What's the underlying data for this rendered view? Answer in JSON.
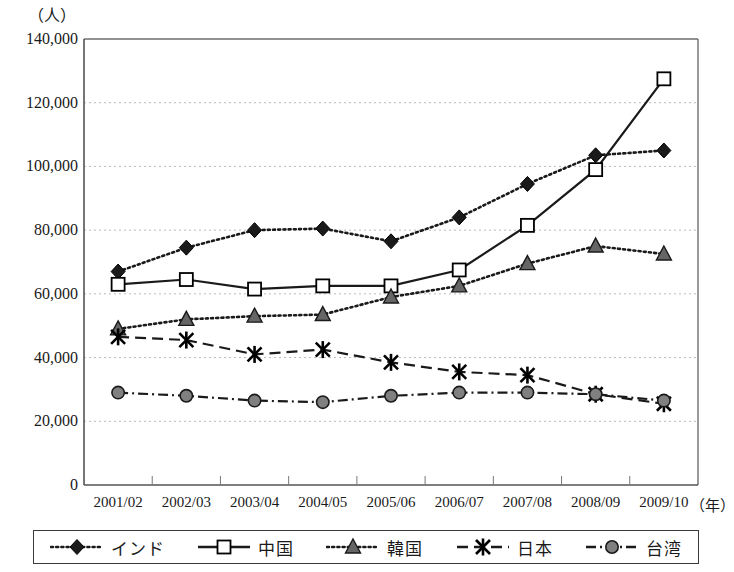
{
  "axes": {
    "y_unit": "（人）",
    "x_unit": "（年）",
    "y_ticks": [
      "140,000",
      "120,000",
      "100,000",
      "80,000",
      "60,000",
      "40,000",
      "20,000",
      "0"
    ],
    "x_ticks": [
      "2001/02",
      "2002/03",
      "2003/04",
      "2004/05",
      "2005/06",
      "2006/07",
      "2007/08",
      "2008/09",
      "2009/10"
    ]
  },
  "legend": {
    "items": [
      {
        "label": "インド",
        "marker": "diamond",
        "line": "dotted",
        "color": "#1a1a1a",
        "fill": "#1a1a1a"
      },
      {
        "label": "中国",
        "marker": "square",
        "line": "solid",
        "color": "#1a1a1a",
        "fill": "#ffffff"
      },
      {
        "label": "韓国",
        "marker": "triangle",
        "line": "dotted",
        "color": "#1a1a1a",
        "fill": "#666666"
      },
      {
        "label": "日本",
        "marker": "cross",
        "line": "dashed",
        "color": "#1a1a1a",
        "fill": "#1a1a1a"
      },
      {
        "label": "台湾",
        "marker": "circle",
        "line": "dashdot",
        "color": "#1a1a1a",
        "fill": "#808080"
      }
    ]
  },
  "chart_data": {
    "type": "line",
    "title": "",
    "xlabel": "（年）",
    "ylabel": "（人）",
    "ylim": [
      0,
      140000
    ],
    "ytick_step": 20000,
    "grid": true,
    "legend_position": "bottom",
    "categories": [
      "2001/02",
      "2002/03",
      "2003/04",
      "2004/05",
      "2005/06",
      "2006/07",
      "2007/08",
      "2008/09",
      "2009/10"
    ],
    "series": [
      {
        "name": "インド",
        "values": [
          67000,
          74500,
          80000,
          80500,
          76500,
          84000,
          94500,
          103500,
          105000
        ]
      },
      {
        "name": "中国",
        "values": [
          63000,
          64500,
          61500,
          62500,
          62500,
          67500,
          81500,
          99000,
          127500
        ]
      },
      {
        "name": "韓国",
        "values": [
          49000,
          52000,
          53000,
          53500,
          59000,
          62500,
          69500,
          75000,
          72500
        ]
      },
      {
        "name": "日本",
        "values": [
          46500,
          45500,
          41000,
          42500,
          38500,
          35500,
          34500,
          28500,
          25500
        ]
      },
      {
        "name": "台湾",
        "values": [
          29000,
          28000,
          26500,
          26000,
          28000,
          29000,
          29000,
          28500,
          26500
        ]
      }
    ]
  }
}
